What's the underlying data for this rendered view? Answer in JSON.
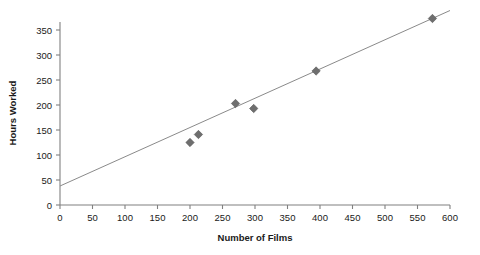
{
  "chart_data": {
    "type": "scatter",
    "title": "",
    "xlabel": "Number of Films",
    "ylabel": "Hours Worked",
    "xlim": [
      0,
      600
    ],
    "ylim": [
      0,
      350
    ],
    "xticks": [
      0,
      50,
      100,
      150,
      200,
      250,
      300,
      350,
      400,
      450,
      500,
      550,
      600
    ],
    "yticks": [
      0,
      50,
      100,
      150,
      200,
      250,
      300,
      350
    ],
    "grid": false,
    "legend": null,
    "marker_shape": "diamond",
    "marker_color": "#6e6e6e",
    "line_color": "#8a8a8a",
    "points": [
      {
        "x": 200,
        "y": 125
      },
      {
        "x": 213,
        "y": 141
      },
      {
        "x": 270,
        "y": 203
      },
      {
        "x": 298,
        "y": 193
      },
      {
        "x": 394,
        "y": 268
      },
      {
        "x": 573,
        "y": 373
      }
    ],
    "trendline": {
      "label": "",
      "x0": 0,
      "y0": 38,
      "x1": 600,
      "y1": 389
    }
  },
  "axes": {
    "x_title": "Number of Films",
    "y_title": "Hours Worked",
    "x_tick_labels": [
      "0",
      "50",
      "100",
      "150",
      "200",
      "250",
      "300",
      "350",
      "400",
      "450",
      "500",
      "550",
      "600"
    ],
    "y_tick_labels": [
      "0",
      "50",
      "100",
      "150",
      "200",
      "250",
      "300",
      "350"
    ]
  },
  "colors": {
    "marker": "#6e6e6e",
    "line": "#8a8a8a",
    "axis": "#808080",
    "text": "#1a1a1a",
    "background": "#ffffff"
  }
}
